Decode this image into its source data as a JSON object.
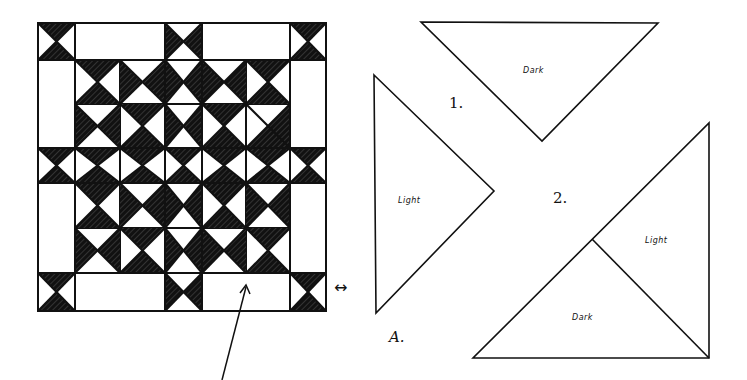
{
  "figure": {
    "quilt_block": {
      "description": "Hand-drawn quilt block made of hourglass / quarter-square triangle units",
      "grid_cols": [
        38,
        75,
        165,
        202,
        290,
        326
      ],
      "grid_rows": [
        23,
        60,
        148,
        183,
        273,
        311
      ],
      "colors": {
        "dark": "#111111",
        "light": "#ffffff",
        "line": "#111111"
      }
    },
    "double_arrow": {
      "glyph": "↔"
    },
    "pointer_arrow": {
      "from": [
        222,
        380
      ],
      "to": [
        246,
        285
      ]
    },
    "diagram_label": "A.",
    "piece_1": {
      "number": "1.",
      "dark_label": "Dark",
      "light_label": "Light"
    },
    "piece_2": {
      "number": "2.",
      "light_label": "Light",
      "dark_label": "Dark"
    }
  }
}
